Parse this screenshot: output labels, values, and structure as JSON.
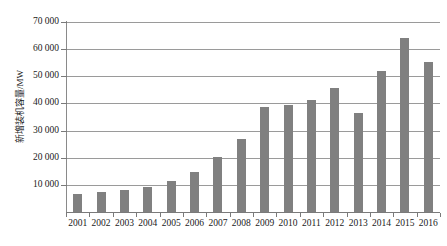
{
  "chart_data": {
    "type": "bar",
    "title": "",
    "subtitle": "",
    "xlabel": "",
    "ylabel": "新增装机容量/MW",
    "categories": [
      "2001",
      "2002",
      "2003",
      "2004",
      "2005",
      "2006",
      "2007",
      "2008",
      "2009",
      "2010",
      "2011",
      "2012",
      "2013",
      "2014",
      "2015",
      "2016"
    ],
    "values": [
      6500,
      7200,
      8200,
      9200,
      11500,
      14800,
      20300,
      27000,
      38800,
      39400,
      41300,
      45600,
      36500,
      52000,
      64000,
      55200
    ],
    "series": [
      {
        "name": "新增装机容量",
        "values": [
          6500,
          7200,
          8200,
          9200,
          11500,
          14800,
          20300,
          27000,
          38800,
          39400,
          41300,
          45600,
          36500,
          52000,
          64000,
          55200
        ]
      }
    ],
    "ylim": [
      0,
      70000
    ],
    "ytick_values": [
      10000,
      20000,
      30000,
      40000,
      50000,
      60000,
      70000
    ],
    "ytick_labels": [
      "10 000",
      "20 000",
      "30 000",
      "40 000",
      "50 000",
      "60 000",
      "70 000"
    ],
    "grid": true,
    "grid_axis": "y",
    "legend": false,
    "legend_position": "none",
    "bar_color": "#808080",
    "grid_color": "#9a9a9a",
    "axis_color": "#7a7a7a",
    "background_color": "#ffffff",
    "text_color": "#1a1a1a"
  }
}
